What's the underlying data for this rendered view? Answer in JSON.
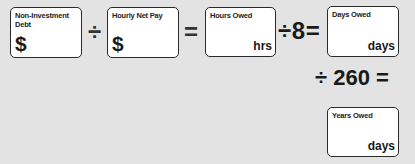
{
  "worksheet": {
    "boxes": {
      "debt": {
        "label_line1": "Non-Investment",
        "label_line2": "Debt",
        "prefix": "$"
      },
      "hourly_pay": {
        "label": "Hourly Net Pay",
        "prefix": "$"
      },
      "hours_owed": {
        "label": "Hours Owed",
        "unit": "hrs"
      },
      "days_owed": {
        "label": "Days Owed",
        "unit": "days"
      },
      "years_owed": {
        "label": "Years Owed",
        "unit": "days"
      }
    },
    "operators": {
      "divide_1": "÷",
      "equals_1": "=",
      "divide_by_8": "÷ 8 =",
      "divide_by_260": "÷ 260 ="
    }
  }
}
